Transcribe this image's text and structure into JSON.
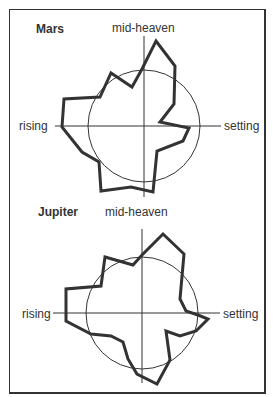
{
  "figure": {
    "border_color": "#333333",
    "line_color": "#333333"
  },
  "chart_data": [
    {
      "type": "radar",
      "title": "Mars",
      "axis_labels": {
        "top": "mid-heaven",
        "left": "rising",
        "right": "setting"
      },
      "center": [
        144,
        126
      ],
      "reference_circle_radius": 56,
      "axes": {
        "horizontal": [
          55,
          221
        ],
        "vertical": [
          36,
          197
        ]
      },
      "polygon": [
        [
          156,
          41
        ],
        [
          175,
          66
        ],
        [
          174,
          104
        ],
        [
          160,
          122
        ],
        [
          189,
          128
        ],
        [
          183,
          141
        ],
        [
          157,
          151
        ],
        [
          153,
          192
        ],
        [
          131,
          187
        ],
        [
          101,
          191
        ],
        [
          99,
          162
        ],
        [
          82,
          152
        ],
        [
          62,
          127
        ],
        [
          64,
          99
        ],
        [
          100,
          97
        ],
        [
          111,
          73
        ],
        [
          132,
          87
        ],
        [
          142,
          69
        ]
      ]
    },
    {
      "type": "radar",
      "title": "Jupiter",
      "axis_labels": {
        "top": "mid-heaven",
        "left": "rising",
        "right": "setting"
      },
      "center": [
        142,
        313
      ],
      "reference_circle_radius": 56,
      "axes": {
        "horizontal": [
          53,
          220
        ],
        "vertical": [
          229,
          383
        ]
      },
      "polygon": [
        [
          163,
          234
        ],
        [
          184,
          254
        ],
        [
          180,
          299
        ],
        [
          186,
          311
        ],
        [
          198,
          315
        ],
        [
          208,
          319
        ],
        [
          196,
          331
        ],
        [
          180,
          336
        ],
        [
          166,
          331
        ],
        [
          170,
          360
        ],
        [
          157,
          384
        ],
        [
          137,
          374
        ],
        [
          128,
          359
        ],
        [
          123,
          342
        ],
        [
          111,
          336
        ],
        [
          91,
          334
        ],
        [
          66,
          321
        ],
        [
          66,
          289
        ],
        [
          101,
          286
        ],
        [
          105,
          257
        ],
        [
          133,
          265
        ],
        [
          142,
          255
        ]
      ]
    }
  ]
}
